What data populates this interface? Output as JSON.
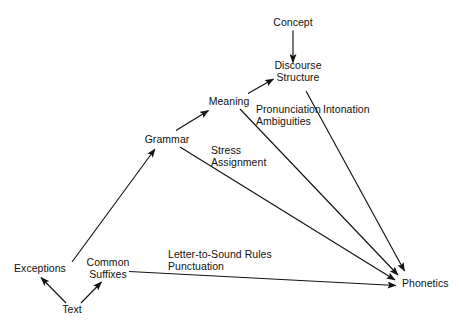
{
  "diagram": {
    "background_color": "#ffffff",
    "ink_color": "#121212",
    "nodes": [
      {
        "id": "concept",
        "label": "Concept",
        "lines": [
          "Concept"
        ],
        "x": 293,
        "y": 23
      },
      {
        "id": "discourse-structure",
        "label": "Discourse Structure",
        "lines": [
          "Discourse",
          "Structure"
        ],
        "x": 298,
        "y": 72
      },
      {
        "id": "meaning",
        "label": "Meaning",
        "lines": [
          "Meaning"
        ],
        "x": 229,
        "y": 102
      },
      {
        "id": "grammar",
        "label": "Grammar",
        "lines": [
          "Grammar"
        ],
        "x": 167,
        "y": 140
      },
      {
        "id": "exceptions",
        "label": "Exceptions",
        "lines": [
          "Exceptions"
        ],
        "x": 40,
        "y": 269
      },
      {
        "id": "common-suffixes",
        "label": "Common Suffixes",
        "lines": [
          "Common",
          "Suffixes"
        ],
        "x": 108,
        "y": 264
      },
      {
        "id": "text",
        "label": "Text",
        "lines": [
          "Text"
        ],
        "x": 72,
        "y": 310
      },
      {
        "id": "phonetics",
        "label": "Phonetics",
        "lines": [
          "Phonetics"
        ],
        "x": 425,
        "y": 284
      }
    ],
    "edge_labels": [
      {
        "id": "pronunciation-ambiguities",
        "lines": [
          "Pronunciation",
          "Ambiguities"
        ],
        "x": 256,
        "y": 110
      },
      {
        "id": "intonation",
        "lines": [
          "Intonation"
        ],
        "x": 323,
        "y": 110
      },
      {
        "id": "stress-assignment",
        "lines": [
          "Stress",
          "Assignment"
        ],
        "x": 211,
        "y": 151
      },
      {
        "id": "letter-to-sound",
        "lines": [
          "Letter-to-Sound Rules",
          "Punctuation"
        ],
        "x": 168,
        "y": 255
      }
    ],
    "edges": [
      {
        "id": "concept-to-discourse",
        "from": "concept",
        "to": "discourse-structure",
        "label": ""
      },
      {
        "id": "meaning-to-discourse",
        "from": "meaning",
        "to": "discourse-structure",
        "label": ""
      },
      {
        "id": "grammar-to-meaning",
        "from": "grammar",
        "to": "meaning",
        "label": ""
      },
      {
        "id": "common-suffixes-to-grammar",
        "from": "common-suffixes",
        "to": "grammar",
        "label": ""
      },
      {
        "id": "text-to-exceptions",
        "from": "text",
        "to": "exceptions",
        "label": ""
      },
      {
        "id": "text-to-common-suffixes",
        "from": "text",
        "to": "common-suffixes",
        "label": ""
      },
      {
        "id": "discourse-to-phonetics",
        "from": "discourse-structure",
        "to": "phonetics",
        "label": "Intonation"
      },
      {
        "id": "meaning-to-phonetics",
        "from": "meaning",
        "to": "phonetics",
        "label": "Pronunciation Ambiguities"
      },
      {
        "id": "grammar-to-phonetics",
        "from": "grammar",
        "to": "phonetics",
        "label": "Stress Assignment"
      },
      {
        "id": "suffixes-to-phonetics",
        "from": "common-suffixes",
        "to": "phonetics",
        "label": "Letter-to-Sound Rules Punctuation"
      }
    ]
  }
}
